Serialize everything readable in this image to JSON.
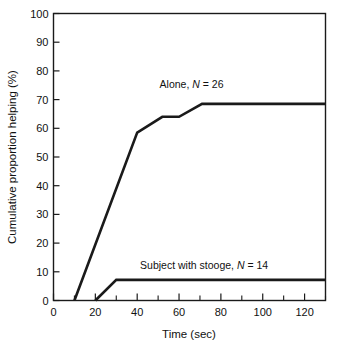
{
  "chart_data": {
    "type": "line",
    "title": "",
    "xlabel": "Time (sec)",
    "ylabel": "Cumulative proportion helping (%)",
    "xlim": [
      0,
      130
    ],
    "ylim": [
      0,
      100
    ],
    "grid": false,
    "legend_position": "inline-above-series",
    "x_ticks_major": [
      0,
      20,
      40,
      60,
      80,
      100,
      120
    ],
    "x_ticks_minor": [
      10,
      30,
      50,
      70,
      90,
      110,
      130
    ],
    "x_tick_labels": [
      "0",
      "20",
      "40",
      "60",
      "80",
      "100",
      "120"
    ],
    "y_ticks_major": [
      0,
      10,
      20,
      30,
      40,
      50,
      60,
      70,
      80,
      90,
      100
    ],
    "y_tick_labels": [
      "0",
      "10",
      "20",
      "30",
      "40",
      "50",
      "60",
      "70",
      "80",
      "90",
      "100"
    ],
    "series": [
      {
        "name": "Alone",
        "label_text": "Alone, N = 26",
        "label_prefix": "Alone, ",
        "label_italic": "N",
        "label_suffix": " = 26",
        "n": 26,
        "color": "#1a1a1a",
        "points": [
          {
            "x": 10,
            "y": 0
          },
          {
            "x": 40,
            "y": 58.5
          },
          {
            "x": 52,
            "y": 64
          },
          {
            "x": 60,
            "y": 64
          },
          {
            "x": 71,
            "y": 68.5
          },
          {
            "x": 130,
            "y": 68.5
          }
        ]
      },
      {
        "name": "Subject with stooge",
        "label_text": "Subject with stooge, N = 14",
        "label_prefix": "Subject with stooge, ",
        "label_italic": "N",
        "label_suffix": " = 14",
        "n": 14,
        "color": "#1a1a1a",
        "points": [
          {
            "x": 20,
            "y": 0
          },
          {
            "x": 30,
            "y": 7.2
          },
          {
            "x": 130,
            "y": 7.2
          }
        ]
      }
    ],
    "annotations": [
      {
        "text": "Alone, N = 26",
        "x": 66,
        "y": 74
      },
      {
        "text": "Subject with stooge, N = 14",
        "x": 72,
        "y": 11
      }
    ]
  },
  "axes": {
    "x_label": "Time (sec)",
    "y_label": "Cumulative proportion helping (%)"
  }
}
